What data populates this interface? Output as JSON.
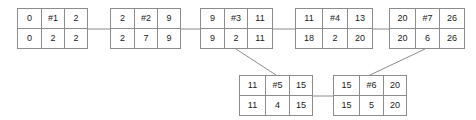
{
  "diagram": {
    "colors": {
      "border": "#8c8c8c",
      "text": "#1a1a1a",
      "link": "#8c8c8c",
      "background": "#ffffff"
    },
    "nodes": [
      {
        "id": "node-1",
        "label": "#1",
        "top": [
          "0",
          "#1",
          "2"
        ],
        "bottom": [
          "0",
          "2",
          "2"
        ],
        "x": 17,
        "y": 8,
        "w": 71,
        "h": 41,
        "cell_widths": [
          23,
          24,
          22
        ]
      },
      {
        "id": "node-2",
        "label": "#2",
        "top": [
          "2",
          "#2",
          "9"
        ],
        "bottom": [
          "2",
          "7",
          "9"
        ],
        "x": 110,
        "y": 8,
        "w": 71,
        "h": 41,
        "cell_widths": [
          23,
          24,
          22
        ]
      },
      {
        "id": "node-3",
        "label": "#3",
        "top": [
          "9",
          "#3",
          "11"
        ],
        "bottom": [
          "9",
          "2",
          "11"
        ],
        "x": 200,
        "y": 8,
        "w": 73,
        "h": 41,
        "cell_widths": [
          23,
          24,
          24
        ]
      },
      {
        "id": "node-4",
        "label": "#4",
        "top": [
          "11",
          "#4",
          "13"
        ],
        "bottom": [
          "18",
          "2",
          "20"
        ],
        "x": 295,
        "y": 8,
        "w": 78,
        "h": 41,
        "cell_widths": [
          26,
          26,
          24
        ]
      },
      {
        "id": "node-7",
        "label": "#7",
        "top": [
          "20",
          "#7",
          "26"
        ],
        "bottom": [
          "20",
          "6",
          "26"
        ],
        "x": 389,
        "y": 8,
        "w": 76,
        "h": 41,
        "cell_widths": [
          25,
          25,
          24
        ]
      },
      {
        "id": "node-5",
        "label": "#5",
        "top": [
          "11",
          "#5",
          "15"
        ],
        "bottom": [
          "11",
          "4",
          "15"
        ],
        "x": 239,
        "y": 75,
        "w": 74,
        "h": 41,
        "cell_widths": [
          25,
          25,
          22
        ]
      },
      {
        "id": "node-6",
        "label": "#6",
        "top": [
          "15",
          "#6",
          "20"
        ],
        "bottom": [
          "15",
          "5",
          "20"
        ],
        "x": 333,
        "y": 75,
        "w": 74,
        "h": 41,
        "cell_widths": [
          25,
          25,
          22
        ]
      }
    ],
    "links": [
      {
        "name": "link-node1-node2",
        "kind": "horizontal",
        "x1": 88,
        "y1": 29,
        "x2": 110,
        "y2": 29
      },
      {
        "name": "link-node2-node3",
        "kind": "horizontal",
        "x1": 181,
        "y1": 29,
        "x2": 200,
        "y2": 29
      },
      {
        "name": "link-node3-node4",
        "kind": "horizontal",
        "x1": 273,
        "y1": 29,
        "x2": 295,
        "y2": 29
      },
      {
        "name": "link-node4-node7",
        "kind": "horizontal",
        "x1": 373,
        "y1": 29,
        "x2": 389,
        "y2": 29
      },
      {
        "name": "link-node5-node6",
        "kind": "horizontal",
        "x1": 313,
        "y1": 96,
        "x2": 333,
        "y2": 96
      },
      {
        "name": "link-node3-node5",
        "kind": "diagonal",
        "x1": 236,
        "y1": 49,
        "x2": 276,
        "y2": 75
      },
      {
        "name": "link-node7-node6",
        "kind": "diagonal",
        "x1": 425,
        "y1": 49,
        "x2": 370,
        "y2": 75
      }
    ]
  }
}
